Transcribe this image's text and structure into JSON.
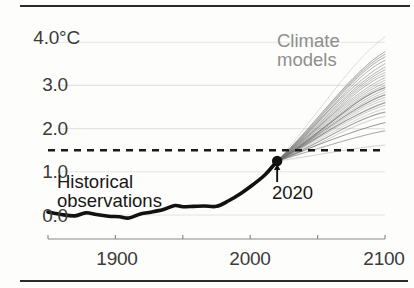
{
  "figure": {
    "name": "global-warming-projection-chart",
    "top_rule": "rule",
    "bottom_rule": "rule"
  },
  "annotations": {
    "historical_line1": "Historical",
    "historical_line2": "observations",
    "models_line1": "Climate",
    "models_line2": "models",
    "marker_year": "2020"
  },
  "colors": {
    "historical_line": "#111111",
    "model_lines": "#6e6e6e",
    "threshold_dashed": "#1a1a1a",
    "gridline": "#e4e4e0",
    "axis": "#8a8a8a",
    "text": "#333333",
    "models_label": "#8e8e8e",
    "rule": "#2b2b2b"
  },
  "chart_data": {
    "type": "line",
    "title": "",
    "xlabel": "",
    "ylabel": "",
    "yunit": "°C",
    "xlim": [
      1850,
      2100
    ],
    "ylim": [
      -0.3,
      4.3
    ],
    "yticks": [
      0.0,
      1.0,
      2.0,
      3.0,
      4.0
    ],
    "ytick_labels": [
      "0.0",
      "1.0",
      "2.0",
      "3.0",
      "4.0°C"
    ],
    "xticks": [
      1850,
      1900,
      1950,
      2000,
      2050,
      2100
    ],
    "xtick_labels": [
      "",
      "1900",
      "",
      "2000",
      "",
      "2100"
    ],
    "grid": true,
    "legend": "annotations-inline",
    "threshold_line": {
      "label": "1.5",
      "value": 1.5,
      "style": "dashed",
      "extent": [
        1850,
        2100
      ]
    },
    "marker_point": {
      "label": "2020",
      "x": 2020,
      "y": 1.25
    },
    "series": [
      {
        "name": "Historical observations",
        "style": "solid-thick-black",
        "x": [
          1850,
          1860,
          1870,
          1878,
          1886,
          1895,
          1903,
          1910,
          1918,
          1925,
          1935,
          1944,
          1950,
          1958,
          1966,
          1975,
          1984,
          1993,
          2002,
          2011,
          2020
        ],
        "values": [
          0.07,
          0.01,
          -0.02,
          0.05,
          0.01,
          -0.03,
          -0.04,
          -0.07,
          0.02,
          0.06,
          0.12,
          0.22,
          0.19,
          0.2,
          0.21,
          0.2,
          0.33,
          0.5,
          0.7,
          0.93,
          1.25
        ]
      },
      {
        "name": "Climate models",
        "style": "spaghetti-gray",
        "count": 28,
        "x": [
          2020,
          2100
        ],
        "start_value": 1.25,
        "end_value_min": 1.62,
        "end_value_max": 4.12,
        "end_values": [
          4.12,
          3.78,
          3.72,
          3.66,
          3.58,
          3.5,
          3.42,
          3.36,
          3.3,
          3.24,
          3.18,
          3.12,
          3.06,
          3.0,
          2.95,
          2.9,
          2.84,
          2.78,
          2.72,
          2.66,
          2.6,
          2.54,
          2.46,
          2.38,
          2.28,
          2.14,
          1.95,
          1.62
        ]
      }
    ]
  }
}
